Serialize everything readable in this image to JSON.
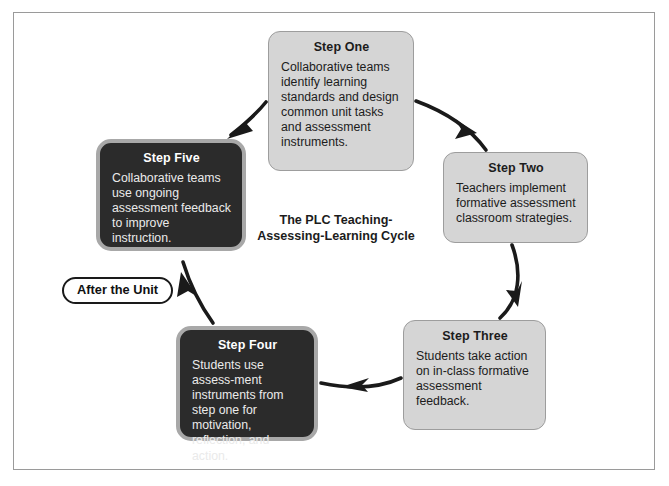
{
  "diagram": {
    "center_title_line1": "The PLC Teaching-",
    "center_title_line2": "Assessing-Learning Cycle",
    "phase_label": "After the Unit",
    "colors": {
      "light_box_fill": "#d5d5d5",
      "light_box_border": "#9d9d9d",
      "dark_box_fill": "#2b2b2b",
      "dark_box_border": "#a8a8a8",
      "arrow": "#1a1a1a",
      "frame_border": "#9a9a9a",
      "text_dark": "#1c1c1c",
      "text_light": "#eaeaea"
    },
    "steps": [
      {
        "id": "step-one",
        "title": "Step One",
        "body": "Collaborative teams identify learning standards and design common unit tasks and assessment instruments.",
        "style": "light"
      },
      {
        "id": "step-two",
        "title": "Step Two",
        "body": "Teachers implement formative assessment classroom strategies.",
        "style": "light"
      },
      {
        "id": "step-three",
        "title": "Step Three",
        "body": "Students take action on in-class formative assessment feedback.",
        "style": "light"
      },
      {
        "id": "step-four",
        "title": "Step Four",
        "body": "Students use assess-ment instruments from step one for motivation, reflection, and action.",
        "style": "dark"
      },
      {
        "id": "step-five",
        "title": "Step Five",
        "body": "Collaborative teams use ongoing assessment feedback to improve instruction.",
        "style": "dark"
      }
    ],
    "arrows": [
      {
        "id": "arrow-one-to-two",
        "from": "step-one",
        "to": "step-two"
      },
      {
        "id": "arrow-two-to-three",
        "from": "step-two",
        "to": "step-three"
      },
      {
        "id": "arrow-three-to-four",
        "from": "step-three",
        "to": "step-four"
      },
      {
        "id": "arrow-four-to-five",
        "from": "step-four",
        "to": "step-five"
      },
      {
        "id": "arrow-five-to-one",
        "from": "step-five",
        "to": "step-one"
      }
    ]
  }
}
